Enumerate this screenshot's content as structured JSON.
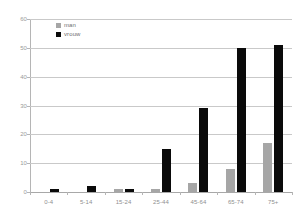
{
  "chart_data": {
    "type": "bar",
    "title": "",
    "xlabel": "",
    "ylabel": "",
    "categories": [
      "0-4",
      "5-14",
      "15-24",
      "25-44",
      "45-64",
      "65-74",
      "75+"
    ],
    "series": [
      {
        "name": "man",
        "color": "#a6a6a6",
        "values": [
          0,
          0,
          1,
          1,
          3,
          8,
          17
        ]
      },
      {
        "name": "vrouw",
        "color": "#0a0a0a",
        "values": [
          1,
          2,
          1,
          15,
          29,
          50,
          51
        ]
      }
    ],
    "ylim": [
      0,
      60
    ],
    "yticks": [
      0,
      10,
      20,
      30,
      40,
      50,
      60
    ],
    "ytick_labels": [
      "0",
      "10",
      "20",
      "30",
      "40",
      "50",
      "60"
    ],
    "grid": true,
    "legend_position": "upper-left"
  },
  "legend": {
    "items": [
      {
        "label": "man"
      },
      {
        "label": "vrouw"
      }
    ]
  }
}
